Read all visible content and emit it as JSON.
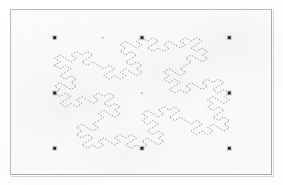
{
  "figure": {
    "kind": "scanned-figure",
    "caption": "",
    "background_color": "#faf9f8",
    "page_color": "#ffffff",
    "border_color": "#b9b9b9",
    "frame": {
      "x": 10,
      "y": 9,
      "width": 262,
      "height": 166
    }
  },
  "chart_data": {
    "type": "scatter",
    "title": "",
    "subtitle": "",
    "xlabel": "",
    "ylabel": "",
    "grid": false,
    "legend_position": "none",
    "xlim": [
      -1.5,
      1.5
    ],
    "ylim": [
      -1.5,
      1.5
    ],
    "xticks": [],
    "yticks": [],
    "annotations": [],
    "series": [
      {
        "name": "control-points",
        "marker": "square",
        "marker_color": "#2b2b2b",
        "marker_size": 3,
        "points": [
          {
            "x": -1.0,
            "y": 1.0,
            "label": ""
          },
          {
            "x": 0.0,
            "y": 1.0,
            "label": ""
          },
          {
            "x": 1.0,
            "y": 1.0,
            "label": ""
          },
          {
            "x": -1.0,
            "y": 0.0,
            "label": ""
          },
          {
            "x": 1.0,
            "y": 0.0,
            "label": ""
          },
          {
            "x": -1.0,
            "y": -1.0,
            "label": ""
          },
          {
            "x": 0.0,
            "y": -1.0,
            "label": ""
          },
          {
            "x": 1.0,
            "y": -1.0,
            "label": ""
          }
        ]
      },
      {
        "name": "faint-points",
        "marker": "dot",
        "marker_color": "#b4b4b4",
        "marker_size": 2,
        "points": [
          {
            "x": -0.45,
            "y": 1.0,
            "label": ""
          },
          {
            "x": -1.0,
            "y": 0.5,
            "label": ""
          },
          {
            "x": 0.0,
            "y": 0.0,
            "label": ""
          }
        ]
      },
      {
        "name": "fractal-curve",
        "marker": "none",
        "line_style": "dashed",
        "line_color": "#8e8e8e",
        "line_width": 1,
        "description": "quadratic Koch island iterated on a diamond (rhombus) base; staircase indentations on each of the four sides",
        "vertices_base": [
          {
            "x": 0.0,
            "y": 1.0
          },
          {
            "x": 1.0,
            "y": 0.0
          },
          {
            "x": 0.0,
            "y": -1.0
          },
          {
            "x": -1.0,
            "y": 0.0
          }
        ],
        "iterations": 2
      }
    ]
  }
}
